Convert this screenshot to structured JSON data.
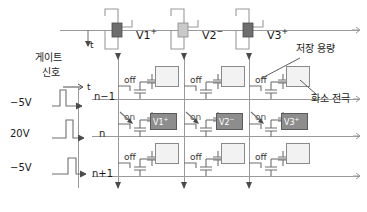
{
  "figure": {
    "title_text": "",
    "colors": {
      "line": "#9a9a9a",
      "dark_line": "#4a4a4a",
      "text": "#1a1a1a",
      "pixel_off_fill": "#f2f2f2",
      "pixel_on_fill": "#8d8d8d",
      "data_pulse_dark": "#6e6e6e",
      "data_pulse_light": "#c9c9c9"
    }
  },
  "data_lines": {
    "axis_time_label": "t",
    "columns": [
      {
        "id": "col1",
        "label": "V1",
        "polarity": "+",
        "pulse_fill": "dark"
      },
      {
        "id": "col2",
        "label": "V2",
        "polarity": "−",
        "pulse_fill": "light"
      },
      {
        "id": "col3",
        "label": "V3",
        "polarity": "+",
        "pulse_fill": "dark"
      }
    ]
  },
  "gate_signal": {
    "title_line1": "게이트",
    "title_line2": "신호",
    "axis_time_label": "t",
    "waveforms": [
      {
        "row": "n−1",
        "voltage_label": "−5V",
        "pulse_position": "early"
      },
      {
        "row": "n",
        "voltage_label": "20V",
        "pulse_position": "middle"
      },
      {
        "row": "n+1",
        "voltage_label": "−5V",
        "pulse_position": "late"
      }
    ]
  },
  "row_labels": [
    "n−1",
    "n",
    "n+1"
  ],
  "pixel_matrix": {
    "rows": [
      {
        "row_label": "n−1",
        "cells": [
          {
            "switch_state": "off",
            "pixel_charged": false,
            "pixel_label": ""
          },
          {
            "switch_state": "off",
            "pixel_charged": false,
            "pixel_label": ""
          },
          {
            "switch_state": "off",
            "pixel_charged": false,
            "pixel_label": ""
          }
        ]
      },
      {
        "row_label": "n",
        "cells": [
          {
            "switch_state": "on",
            "pixel_charged": true,
            "pixel_label": "V1",
            "pixel_polarity": "+"
          },
          {
            "switch_state": "on",
            "pixel_charged": true,
            "pixel_label": "V2",
            "pixel_polarity": "−"
          },
          {
            "switch_state": "on",
            "pixel_charged": true,
            "pixel_label": "V3",
            "pixel_polarity": "+"
          }
        ]
      },
      {
        "row_label": "n+1",
        "cells": [
          {
            "switch_state": "off",
            "pixel_charged": false,
            "pixel_label": ""
          },
          {
            "switch_state": "off",
            "pixel_charged": false,
            "pixel_label": ""
          },
          {
            "switch_state": "off",
            "pixel_charged": false,
            "pixel_label": ""
          }
        ]
      }
    ]
  },
  "annotations": [
    {
      "id": "storage-capacitance",
      "text": "저장 용량"
    },
    {
      "id": "pixel-electrode",
      "text": "화소 전극"
    }
  ],
  "cell_labels": {
    "on": "on",
    "off": "off"
  }
}
